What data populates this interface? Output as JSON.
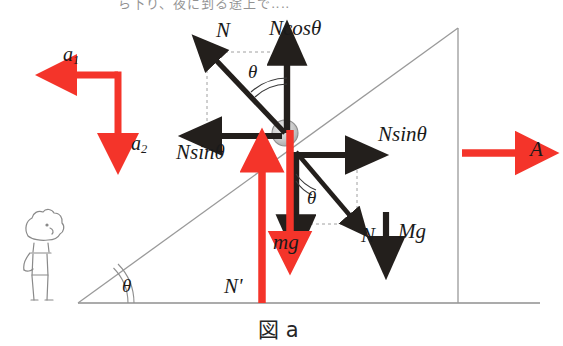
{
  "figure": {
    "caption": "図 a",
    "top_cut_text": "ら下り、夜に到る途上で‥‥",
    "colors": {
      "red_vector": "#f4342a",
      "black_vector": "#231f1c",
      "outline": "#8a8a8a",
      "ball_fill": "#c9c9c9",
      "dashed_guide": "#9a9a9a",
      "text": "#1a1a1a"
    },
    "geometry": {
      "incline_angle_symbol": "θ",
      "ball_center": [
        285,
        133
      ],
      "ball_radius": 13,
      "apex": [
        458,
        28
      ],
      "base_left": [
        78,
        303
      ],
      "base_right": [
        540,
        303
      ]
    }
  },
  "labels": {
    "accel_horizontal": "a",
    "accel_horizontal_sub": "1",
    "accel_vertical": "a",
    "accel_vertical_sub": "2",
    "normal_force": "N",
    "normal_cos": "Ncos",
    "normal_cos_theta": "θ",
    "normal_sin_left": "Nsin",
    "normal_sin_left_theta": "θ",
    "normal_sin_right": "Nsin",
    "normal_sin_right_theta": "θ",
    "reaction_normal": "N",
    "wedge_accel": "A",
    "ball_weight": "mg",
    "wedge_weight": "Mg",
    "ground_normal": "N'",
    "angle_top": "θ",
    "angle_lower": "θ",
    "angle_base": "θ"
  }
}
